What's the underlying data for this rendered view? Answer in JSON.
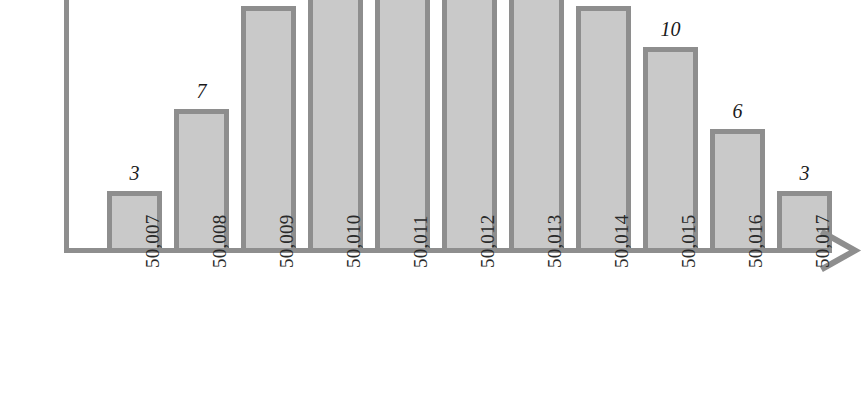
{
  "chart_data": {
    "type": "bar",
    "title": "",
    "subtitle": "",
    "xlabel": "",
    "ylabel": "",
    "categories": [
      "50,007",
      "50,008",
      "50,009",
      "50,010",
      "50,011",
      "50,012",
      "50,013",
      "50,014",
      "50,015",
      "50,016",
      "50,017"
    ],
    "values": [
      3,
      7,
      12,
      16,
      16,
      16,
      16,
      12,
      10,
      6,
      3
    ],
    "point_labels": [
      "3",
      "7",
      "",
      "",
      "",
      "",
      "",
      "",
      "10",
      "6",
      "3"
    ],
    "ylim": [
      0,
      12.3
    ],
    "grid": false,
    "legend": null,
    "axis_arrow_x": true,
    "tick_label_rotation_deg": -90
  },
  "style": {
    "bar_fill": "#c9c9c9",
    "bar_border": "#8e8e8e",
    "axis_color": "#8e8e8e",
    "label_color": "#1a1a1a",
    "tick_color": "#2a2a2a",
    "background": "#ffffff"
  },
  "geometry": {
    "baseline_y": 250,
    "unit_px": 20.6,
    "bar_width": 55,
    "bar_pitch": 67,
    "first_bar_left": 107
  }
}
